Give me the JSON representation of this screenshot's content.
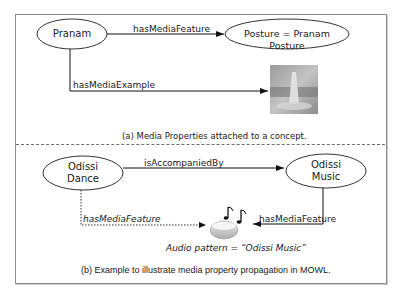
{
  "figure": {
    "panel_a": {
      "nodes": {
        "concept": "Pranam",
        "feature": "Posture = Pranam Posture"
      },
      "edges": {
        "feature_edge": "hasMediaFeature",
        "example_edge": "hasMediaExample"
      },
      "media_example": "image-thumbnail",
      "caption": "(a) Media Properties attached to a concept."
    },
    "panel_b": {
      "nodes": {
        "source_line1": "Odissi",
        "source_line2": "Dance",
        "target_line1": "Odissi",
        "target_line2": "Music"
      },
      "edges": {
        "accompany_edge": "isAccompaniedBy",
        "feature_edge": "hasMediaFeature",
        "propagated_edge": "hasMediaFeature"
      },
      "media_label": "Audio pattern = “Odissi Music”",
      "media_icon": "audio-icon",
      "caption": "(b) Example to illustrate media property propagation in MOWL."
    }
  }
}
